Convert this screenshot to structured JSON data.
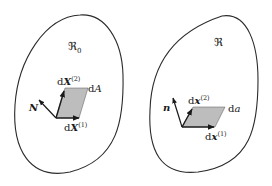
{
  "figure": {
    "reference": {
      "region_label": "ℜ",
      "region_subscript": "0",
      "normal_label": "N",
      "vector1_label": "dX",
      "vector1_sup": "(1)",
      "vector2_label": "dX",
      "vector2_sup": "(2)",
      "area_label": "dA"
    },
    "current": {
      "region_label": "ℜ",
      "normal_label": "n",
      "vector1_label": "dx",
      "vector1_sup": "(1)",
      "vector2_label": "dx",
      "vector2_sup": "(2)",
      "area_label": "da"
    },
    "colors": {
      "outline": "#2b2b2b",
      "area_fill": "#bdbdbd",
      "arrow": "#1a1a1a"
    }
  }
}
